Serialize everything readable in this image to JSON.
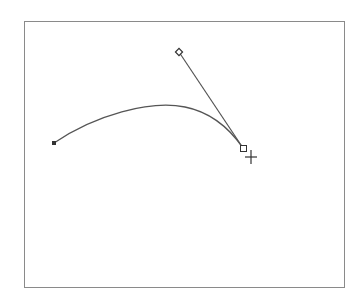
{
  "canvas": {
    "frame": {
      "x": 24,
      "y": 21,
      "width": 321,
      "height": 267
    },
    "stroke_color": "#555555",
    "path": {
      "start_anchor": {
        "x": 54,
        "y": 143
      },
      "end_anchor": {
        "x": 243,
        "y": 148
      },
      "start_control": {
        "x": 120,
        "y": 95
      },
      "end_control": {
        "x": 215,
        "y": 100
      }
    },
    "direction_handle": {
      "x": 179,
      "y": 52
    },
    "cursor": {
      "type": "crosshair",
      "x": 251,
      "y": 157
    }
  }
}
